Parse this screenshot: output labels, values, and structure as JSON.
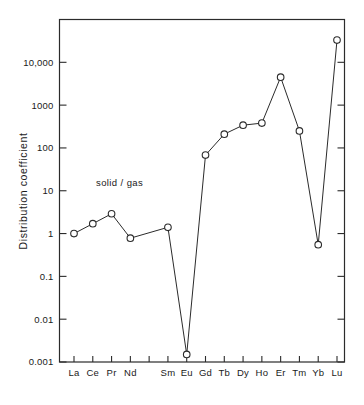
{
  "chart_data": {
    "type": "line",
    "title": "",
    "subtitle": "",
    "xlabel": "",
    "ylabel": "Distribution  coefficient",
    "yscale": "log",
    "ylim": [
      0.001,
      100000
    ],
    "grid": false,
    "legend_position": "none",
    "annotations": [
      {
        "name": "series-annotation",
        "text": "solid / gas",
        "x": "Pr",
        "y": 8
      }
    ],
    "ytick_labels": [
      "10,000",
      "1000",
      "100",
      "10",
      "1",
      "0.1",
      "0.01",
      "0.001"
    ],
    "ytick_values": [
      10000,
      1000,
      100,
      10,
      1,
      0.1,
      0.01,
      0.001
    ],
    "xtick_labels": [
      "La",
      "Ce",
      "Pr",
      "Nd",
      "",
      "Sm",
      "Eu",
      "Gd",
      "Tb",
      "Dy",
      "Ho",
      "Er",
      "Tm",
      "Yb",
      "Lu"
    ],
    "categories": [
      "La",
      "Ce",
      "Pr",
      "Nd",
      "Pm",
      "Sm",
      "Eu",
      "Gd",
      "Tb",
      "Dy",
      "Ho",
      "Er",
      "Tm",
      "Yb",
      "Lu"
    ],
    "series": [
      {
        "name": "solid / gas",
        "marker": "open-circle",
        "color": "#2b2b2b",
        "values": [
          1.0,
          1.7,
          2.9,
          0.78,
          null,
          1.4,
          0.0015,
          68,
          210,
          340,
          380,
          4500,
          250,
          0.55,
          33000
        ]
      }
    ],
    "points": [
      {
        "label": "La",
        "value": 1.0
      },
      {
        "label": "Ce",
        "value": 1.7
      },
      {
        "label": "Pr",
        "value": 2.9
      },
      {
        "label": "Nd",
        "value": 0.78
      },
      {
        "label": "Sm",
        "value": 1.4
      },
      {
        "label": "Eu",
        "value": 0.0015
      },
      {
        "label": "Gd",
        "value": 68
      },
      {
        "label": "Tb",
        "value": 210
      },
      {
        "label": "Dy",
        "value": 340
      },
      {
        "label": "Ho",
        "value": 380
      },
      {
        "label": "Er",
        "value": 4500
      },
      {
        "label": "Tm",
        "value": 250
      },
      {
        "label": "Yb",
        "value": 0.55
      },
      {
        "label": "Lu",
        "value": 33000
      }
    ]
  },
  "axes": {
    "y_title": "Distribution  coefficient",
    "y_ticks": [
      {
        "label": "10,000"
      },
      {
        "label": "1000"
      },
      {
        "label": "100"
      },
      {
        "label": "10"
      },
      {
        "label": "1"
      },
      {
        "label": "0.1"
      },
      {
        "label": "0.01"
      },
      {
        "label": "0.001"
      }
    ],
    "x_ticks": [
      {
        "label": "La"
      },
      {
        "label": "Ce"
      },
      {
        "label": "Pr"
      },
      {
        "label": "Nd"
      },
      {
        "label": ""
      },
      {
        "label": "Sm"
      },
      {
        "label": "Eu"
      },
      {
        "label": "Gd"
      },
      {
        "label": "Tb"
      },
      {
        "label": "Dy"
      },
      {
        "label": "Ho"
      },
      {
        "label": "Er"
      },
      {
        "label": "Tm"
      },
      {
        "label": "Yb"
      },
      {
        "label": "Lu"
      }
    ]
  },
  "annotation": {
    "solid_gas_label": "solid / gas"
  },
  "colors": {
    "ink": "#2b2b2b",
    "background": "#ffffff",
    "marker_fill": "#ffffff"
  }
}
